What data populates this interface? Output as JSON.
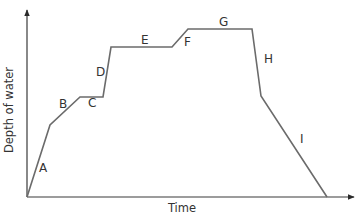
{
  "chart_data": {
    "type": "line",
    "title": "",
    "xlabel": "Time",
    "ylabel": "Depth of water",
    "grid": false,
    "legend": null,
    "ticks": "none",
    "axis_ranges": {
      "x": [
        0,
        325
      ],
      "y": [
        0,
        185
      ]
    },
    "points": [
      {
        "x": 0,
        "y": 0
      },
      {
        "x": 23,
        "y": 72
      },
      {
        "x": 53,
        "y": 100
      },
      {
        "x": 76,
        "y": 100
      },
      {
        "x": 84,
        "y": 150
      },
      {
        "x": 145,
        "y": 150
      },
      {
        "x": 161,
        "y": 168
      },
      {
        "x": 225,
        "y": 168
      },
      {
        "x": 234,
        "y": 101
      },
      {
        "x": 300,
        "y": 0
      }
    ],
    "segments": [
      {
        "label": "A",
        "from": 0,
        "to": 1,
        "description": "steep rise"
      },
      {
        "label": "B",
        "from": 1,
        "to": 2,
        "description": "gentler rise"
      },
      {
        "label": "C",
        "from": 2,
        "to": 3,
        "description": "level"
      },
      {
        "label": "D",
        "from": 3,
        "to": 4,
        "description": "steep rise"
      },
      {
        "label": "E",
        "from": 4,
        "to": 5,
        "description": "level"
      },
      {
        "label": "F",
        "from": 5,
        "to": 6,
        "description": "rise"
      },
      {
        "label": "G",
        "from": 6,
        "to": 7,
        "description": "level"
      },
      {
        "label": "H",
        "from": 7,
        "to": 8,
        "description": "steep fall"
      },
      {
        "label": "I",
        "from": 8,
        "to": 9,
        "description": "gradual fall to zero"
      }
    ]
  },
  "render": {
    "origin_px": [
      27,
      197
    ],
    "y_axis_top_px": 10,
    "x_axis_right_px": 354,
    "curve_color": "#6b6b6b",
    "axis_color": "#3a3a3a",
    "label_positions": {
      "A": [
        39,
        172
      ],
      "B": [
        59,
        108
      ],
      "C": [
        88,
        107
      ],
      "D": [
        96,
        76
      ],
      "E": [
        141,
        44
      ],
      "F": [
        184,
        46
      ],
      "G": [
        219,
        26
      ],
      "H": [
        264,
        63
      ],
      "I": [
        300,
        143
      ]
    },
    "xlabel_pos": [
      182,
      212
    ],
    "ylabel_pos": [
      13,
      110
    ]
  }
}
